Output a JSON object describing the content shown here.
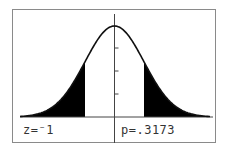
{
  "screen": {
    "type": "graphing-calculator-display",
    "graph": "normal distribution shaded tails",
    "z_readout": "z=⁻1",
    "p_readout": "p=.3173",
    "colors": {
      "curve": "#111111",
      "shade": "#000000",
      "border": "#8a8a8a",
      "text": "#333333"
    },
    "axis": {
      "y_ticks": 3
    },
    "shading": {
      "lower": -1,
      "upper": 1,
      "region": "both tails"
    }
  },
  "chart_data": {
    "type": "area",
    "title": "",
    "distribution": "standard normal",
    "shaded_regions": [
      {
        "from": "-inf",
        "to": -1
      },
      {
        "from": 1,
        "to": "inf"
      }
    ],
    "annotations": [
      "z=⁻1",
      "p=.3173"
    ],
    "xlabel": "",
    "ylabel": ""
  }
}
